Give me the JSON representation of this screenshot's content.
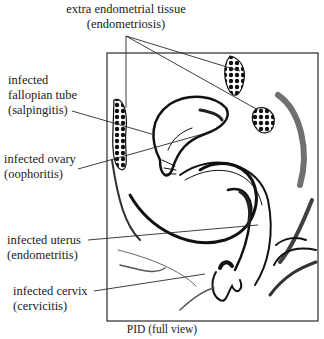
{
  "figure": {
    "caption": "PID (full view)",
    "frame": {
      "x": 107,
      "y": 53,
      "width": 211,
      "height": 268,
      "stroke": "#2a2a2a"
    },
    "labels": [
      {
        "id": "endometriosis",
        "lines": [
          "extra endometrial tissue",
          "(endometriosis)"
        ],
        "x": 126,
        "y": 2,
        "align": "center"
      },
      {
        "id": "salpingitis",
        "lines": [
          "infected",
          "fallopian tube",
          "(salpingitis)"
        ],
        "x": 8,
        "y": 73,
        "align": "left"
      },
      {
        "id": "oophoritis",
        "lines": [
          "infected ovary",
          "(oophoritis)"
        ],
        "x": 4,
        "y": 152,
        "align": "left"
      },
      {
        "id": "endometritis",
        "lines": [
          "infected uterus",
          "(endometritis)"
        ],
        "x": 7,
        "y": 233,
        "align": "left"
      },
      {
        "id": "cervicitis",
        "lines": [
          "infected cervix",
          "(cervicitis)"
        ],
        "x": 13,
        "y": 284,
        "align": "left"
      }
    ],
    "leaders": [
      {
        "for": "endometriosis",
        "points": [
          [
            126,
            36
          ],
          [
            126,
            108
          ]
        ]
      },
      {
        "for": "endometriosis",
        "points": [
          [
            126,
            36
          ],
          [
            240,
            71
          ]
        ]
      },
      {
        "for": "endometriosis",
        "points": [
          [
            126,
            36
          ],
          [
            258,
            110
          ]
        ]
      },
      {
        "for": "salpingitis",
        "points": [
          [
            72,
            111
          ],
          [
            155,
            135
          ]
        ]
      },
      {
        "for": "oophoritis",
        "points": [
          [
            78,
            169
          ],
          [
            203,
            134
          ]
        ]
      },
      {
        "for": "endometritis",
        "points": [
          [
            88,
            240
          ],
          [
            258,
            225
          ]
        ]
      },
      {
        "for": "cervicitis",
        "points": [
          [
            94,
            291
          ],
          [
            205,
            274
          ]
        ]
      }
    ]
  }
}
